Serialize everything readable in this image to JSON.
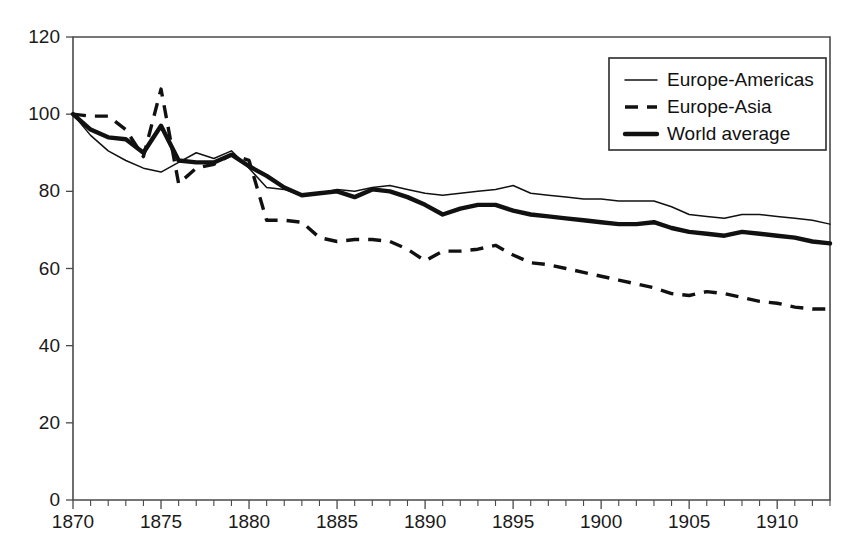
{
  "chart_data": {
    "type": "line",
    "title": "",
    "subtitle": "",
    "xlabel": "",
    "ylabel": "",
    "xlim": [
      1870,
      1913
    ],
    "ylim": [
      0,
      120
    ],
    "grid": false,
    "legend_position": "top-right",
    "y_ticks": [
      0,
      20,
      40,
      60,
      80,
      100,
      120
    ],
    "y_tick_labels": [
      "0",
      "20",
      "40",
      "60",
      "80",
      "100",
      "120"
    ],
    "x_ticks": [
      1870,
      1875,
      1880,
      1885,
      1890,
      1895,
      1900,
      1905,
      1910
    ],
    "x_tick_labels": [
      "1870",
      "1875",
      "1880",
      "1885",
      "1890",
      "1895",
      "1900",
      "1905",
      "1910"
    ],
    "x_minor_tick_step": 1,
    "x": [
      1870,
      1871,
      1872,
      1873,
      1874,
      1875,
      1876,
      1877,
      1878,
      1879,
      1880,
      1881,
      1882,
      1883,
      1884,
      1885,
      1886,
      1887,
      1888,
      1889,
      1890,
      1891,
      1892,
      1893,
      1894,
      1895,
      1896,
      1897,
      1898,
      1899,
      1900,
      1901,
      1902,
      1903,
      1904,
      1905,
      1906,
      1907,
      1908,
      1909,
      1910,
      1911,
      1912,
      1913
    ],
    "series": [
      {
        "name": "Europe-Americas",
        "style": "thin-solid",
        "color": "#111111",
        "values": [
          100,
          94.5,
          90.5,
          88.0,
          86.0,
          85.0,
          87.5,
          90.0,
          88.5,
          90.5,
          86.0,
          81.0,
          80.5,
          79.0,
          79.5,
          80.5,
          80.0,
          81.0,
          81.5,
          80.5,
          79.5,
          79.0,
          79.5,
          80.0,
          80.5,
          81.5,
          79.5,
          79.0,
          78.5,
          78.0,
          78.0,
          77.5,
          77.5,
          77.5,
          76.0,
          74.0,
          73.5,
          73.0,
          74.0,
          74.0,
          73.5,
          73.0,
          72.5,
          71.5
        ]
      },
      {
        "name": "Europe-Asia",
        "style": "dashed",
        "color": "#111111",
        "values": [
          100,
          99.5,
          99.5,
          96.0,
          89.0,
          106.5,
          82.0,
          86.0,
          87.0,
          89.5,
          88.0,
          72.5,
          72.5,
          72.0,
          68.0,
          67.0,
          67.5,
          67.5,
          67.0,
          65.0,
          62.0,
          64.5,
          64.5,
          65.0,
          66.0,
          63.5,
          61.5,
          61.0,
          60.0,
          59.0,
          58.0,
          57.0,
          56.0,
          55.0,
          53.5,
          53.0,
          54.0,
          53.5,
          52.5,
          51.5,
          51.0,
          50.0,
          49.5,
          49.5
        ]
      },
      {
        "name": "World average",
        "style": "thick-solid",
        "color": "#111111",
        "values": [
          100,
          96.0,
          94.0,
          93.5,
          90.0,
          97.0,
          88.0,
          87.5,
          87.5,
          89.5,
          86.5,
          84.0,
          81.0,
          79.0,
          79.5,
          80.0,
          78.5,
          80.5,
          80.0,
          78.5,
          76.5,
          74.0,
          75.5,
          76.5,
          76.5,
          75.0,
          74.0,
          73.5,
          73.0,
          72.5,
          72.0,
          71.5,
          71.5,
          72.0,
          70.5,
          69.5,
          69.0,
          68.5,
          69.5,
          69.0,
          68.5,
          68.0,
          67.0,
          66.5
        ]
      }
    ],
    "legend": [
      {
        "label": "Europe-Americas",
        "style": "thin-solid"
      },
      {
        "label": "Europe-Asia",
        "style": "dashed"
      },
      {
        "label": "World average",
        "style": "thick-solid"
      }
    ]
  }
}
